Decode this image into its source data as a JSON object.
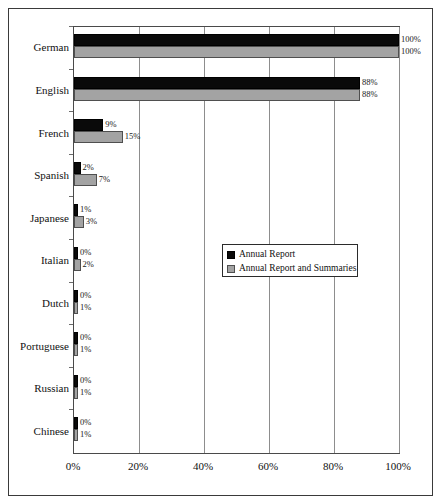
{
  "chart_data": {
    "type": "bar",
    "orientation": "horizontal",
    "title": "",
    "xlabel": "",
    "ylabel": "",
    "categories": [
      "German",
      "English",
      "French",
      "Spanish",
      "Japanese",
      "Italian",
      "Dutch",
      "Portuguese",
      "Russian",
      "Chinese"
    ],
    "series": [
      {
        "name": "Annual Report",
        "color": "#0a0a0a",
        "values": [
          100,
          88,
          9,
          2,
          1,
          0,
          0,
          0,
          0,
          0
        ],
        "labels": [
          "100%",
          "88%",
          "9%",
          "2%",
          "1%",
          "0%",
          "0%",
          "0%",
          "0%",
          "0%"
        ]
      },
      {
        "name": "Annual Report and Summaries",
        "color": "#a3a3a3",
        "values": [
          100,
          88,
          15,
          7,
          3,
          2,
          1,
          1,
          1,
          1
        ],
        "labels": [
          "100%",
          "88%",
          "15%",
          "7%",
          "3%",
          "2%",
          "1%",
          "1%",
          "1%",
          "1%"
        ]
      }
    ],
    "xlim": [
      0,
      100
    ],
    "xticks": [
      0,
      20,
      40,
      60,
      80,
      100
    ],
    "xtick_labels": [
      "0%",
      "20%",
      "40%",
      "60%",
      "80%",
      "100%"
    ],
    "grid": "vertical",
    "legend_position": "middle-right-inside"
  },
  "legend": {
    "entries": [
      {
        "label": "Annual Report",
        "swatch": "black-swatch-icon"
      },
      {
        "label": "Annual Report and Summaries",
        "swatch": "gray-swatch-icon"
      }
    ]
  },
  "axis": {
    "x_tick_labels": [
      "0%",
      "20%",
      "40%",
      "60%",
      "80%",
      "100%"
    ],
    "y_categories": [
      "German",
      "English",
      "French",
      "Spanish",
      "Japanese",
      "Italian",
      "Dutch",
      "Portuguese",
      "Russian",
      "Chinese"
    ]
  }
}
